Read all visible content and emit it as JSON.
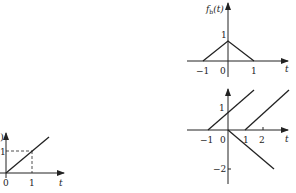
{
  "plots": {
    "small": {
      "y_label": ")",
      "y_tick": "1",
      "x_ticks": [
        "0",
        "1"
      ],
      "x_label": "t"
    },
    "top_right": {
      "y_label_f": "f",
      "y_label_sub": "b",
      "y_label_arg": "(t)",
      "y_tick": "1",
      "x_ticks": [
        "−1",
        "0",
        "1"
      ],
      "x_label": "t"
    },
    "bottom_right": {
      "y_ticks": [
        "1",
        "−2"
      ],
      "x_ticks": [
        "−1",
        "0",
        "1",
        "2"
      ],
      "x_label": "t"
    }
  },
  "colors": {
    "ink": "#222222",
    "background": "#ffffff"
  }
}
